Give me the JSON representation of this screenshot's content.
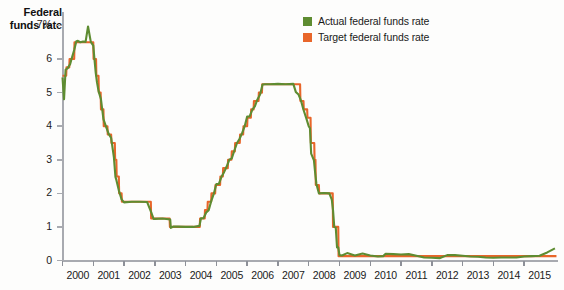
{
  "chart": {
    "title_line1": "Federal",
    "title_line2": "funds rate",
    "legend": [
      {
        "label": "Actual federal funds rate",
        "color": "#5e8c31",
        "icon": "square-swatch-icon"
      },
      {
        "label": "Target federal funds rate",
        "color": "#e8662a",
        "icon": "square-swatch-icon"
      }
    ]
  },
  "chart_data": {
    "type": "line",
    "title": "Federal funds rate",
    "xlabel": "",
    "ylabel": "Federal funds rate",
    "ylim": [
      0,
      7.4
    ],
    "xlim": [
      2000,
      2016.1
    ],
    "grid": false,
    "legend_position": "top-right",
    "ytick_labels": [
      "0",
      "1",
      "2",
      "3",
      "4",
      "5",
      "6",
      "7%"
    ],
    "ytick_values": [
      0,
      1,
      2,
      3,
      4,
      5,
      6,
      7
    ],
    "xtick_labels": [
      "2000",
      "2001",
      "2002",
      "2003",
      "2004",
      "2005",
      "2006",
      "2007",
      "2008",
      "2009",
      "2010",
      "2011",
      "2012",
      "2013",
      "2014",
      "2015"
    ],
    "xtick_values": [
      2000,
      2001,
      2002,
      2003,
      2004,
      2005,
      2006,
      2007,
      2008,
      2009,
      2010,
      2011,
      2012,
      2013,
      2014,
      2015
    ],
    "units": "percent",
    "series": [
      {
        "name": "Actual federal funds rate",
        "color": "#5e8c31",
        "x": [
          2000.0,
          2000.05,
          2000.1,
          2000.17,
          2000.25,
          2000.3,
          2000.38,
          2000.45,
          2000.5,
          2000.58,
          2000.67,
          2000.75,
          2000.83,
          2000.92,
          2001.0,
          2001.04,
          2001.08,
          2001.12,
          2001.17,
          2001.25,
          2001.33,
          2001.42,
          2001.5,
          2001.58,
          2001.67,
          2001.72,
          2001.75,
          2001.83,
          2001.92,
          2002.0,
          2002.25,
          2002.5,
          2002.75,
          2002.88,
          2002.96,
          2003.0,
          2003.25,
          2003.5,
          2003.52,
          2003.6,
          2003.75,
          2004.0,
          2004.25,
          2004.45,
          2004.5,
          2004.58,
          2004.67,
          2004.75,
          2004.83,
          2004.92,
          2005.0,
          2005.08,
          2005.17,
          2005.25,
          2005.33,
          2005.42,
          2005.5,
          2005.58,
          2005.67,
          2005.75,
          2005.83,
          2005.92,
          2006.0,
          2006.08,
          2006.17,
          2006.25,
          2006.33,
          2006.42,
          2006.5,
          2006.58,
          2006.75,
          2007.0,
          2007.25,
          2007.5,
          2007.58,
          2007.67,
          2007.75,
          2007.83,
          2007.92,
          2008.0,
          2008.04,
          2008.08,
          2008.17,
          2008.21,
          2008.25,
          2008.33,
          2008.5,
          2008.67,
          2008.75,
          2008.79,
          2008.83,
          2008.88,
          2008.92,
          2008.96,
          2009.0,
          2009.08,
          2009.25,
          2009.5,
          2009.75,
          2010.0,
          2010.25,
          2010.42,
          2010.5,
          2010.75,
          2011.0,
          2011.25,
          2011.5,
          2011.75,
          2012.0,
          2012.25,
          2012.5,
          2012.75,
          2013.0,
          2013.25,
          2013.5,
          2013.75,
          2014.0,
          2014.25,
          2014.5,
          2014.75,
          2015.0,
          2015.25,
          2015.5,
          2015.75,
          2016.0
        ],
        "y": [
          5.45,
          4.8,
          5.68,
          5.73,
          5.85,
          6.02,
          6.27,
          6.53,
          6.54,
          6.5,
          6.52,
          6.51,
          6.97,
          6.51,
          6.4,
          5.98,
          5.59,
          5.31,
          5.05,
          4.8,
          4.21,
          3.97,
          3.77,
          3.65,
          3.07,
          2.49,
          2.4,
          2.09,
          1.82,
          1.73,
          1.75,
          1.75,
          1.74,
          1.44,
          1.24,
          1.24,
          1.25,
          1.22,
          0.97,
          1.01,
          1.01,
          1.0,
          1.0,
          1.03,
          1.26,
          1.26,
          1.43,
          1.5,
          1.76,
          2.0,
          2.28,
          2.28,
          2.5,
          2.63,
          2.79,
          3.0,
          3.04,
          3.26,
          3.5,
          3.62,
          3.78,
          4.0,
          4.29,
          4.29,
          4.49,
          4.59,
          4.79,
          4.94,
          5.24,
          5.25,
          5.25,
          5.26,
          5.25,
          5.26,
          5.02,
          4.94,
          4.76,
          4.49,
          4.24,
          4.0,
          3.94,
          3.18,
          2.98,
          2.61,
          2.28,
          2.0,
          2.01,
          2.0,
          1.81,
          1.5,
          1.0,
          0.97,
          0.39,
          0.39,
          0.16,
          0.15,
          0.22,
          0.15,
          0.21,
          0.15,
          0.12,
          0.13,
          0.2,
          0.19,
          0.18,
          0.19,
          0.14,
          0.09,
          0.08,
          0.07,
          0.16,
          0.16,
          0.14,
          0.12,
          0.11,
          0.09,
          0.08,
          0.09,
          0.09,
          0.09,
          0.12,
          0.13,
          0.14,
          0.24,
          0.36
        ]
      },
      {
        "name": "Target federal funds rate",
        "color": "#e8662a",
        "x": [
          2000.0,
          2000.12,
          2000.13,
          2000.22,
          2000.23,
          2000.3,
          2000.31,
          2000.38,
          2000.39,
          2000.48,
          2000.49,
          2001.0,
          2001.01,
          2001.09,
          2001.1,
          2001.17,
          2001.18,
          2001.24,
          2001.25,
          2001.33,
          2001.34,
          2001.46,
          2001.47,
          2001.58,
          2001.59,
          2001.7,
          2001.71,
          2001.75,
          2001.76,
          2001.83,
          2001.84,
          2001.92,
          2001.93,
          2002.87,
          2002.88,
          2003.48,
          2003.49,
          2004.46,
          2004.47,
          2004.62,
          2004.63,
          2004.71,
          2004.72,
          2004.83,
          2004.84,
          2004.96,
          2004.97,
          2005.12,
          2005.13,
          2005.21,
          2005.22,
          2005.37,
          2005.38,
          2005.49,
          2005.5,
          2005.6,
          2005.61,
          2005.76,
          2005.77,
          2005.87,
          2005.88,
          2006.0,
          2006.01,
          2006.12,
          2006.13,
          2006.21,
          2006.22,
          2006.37,
          2006.38,
          2006.48,
          2006.49,
          2007.72,
          2007.73,
          2007.83,
          2007.84,
          2007.95,
          2007.96,
          2008.06,
          2008.07,
          2008.18,
          2008.19,
          2008.22,
          2008.23,
          2008.33,
          2008.34,
          2008.78,
          2008.79,
          2008.96,
          2008.97,
          2016.05
        ],
        "y": [
          5.5,
          5.5,
          5.75,
          5.75,
          6.0,
          6.0,
          6.0,
          6.0,
          6.5,
          6.5,
          6.5,
          6.5,
          6.0,
          6.0,
          5.5,
          5.5,
          5.0,
          5.0,
          4.5,
          4.5,
          4.0,
          4.0,
          3.75,
          3.75,
          3.5,
          3.5,
          3.0,
          3.0,
          2.5,
          2.5,
          2.0,
          2.0,
          1.75,
          1.75,
          1.25,
          1.25,
          1.0,
          1.0,
          1.25,
          1.25,
          1.5,
          1.5,
          1.75,
          1.75,
          2.0,
          2.0,
          2.25,
          2.25,
          2.5,
          2.5,
          2.75,
          2.75,
          3.0,
          3.0,
          3.25,
          3.25,
          3.5,
          3.5,
          3.75,
          3.75,
          4.0,
          4.0,
          4.25,
          4.25,
          4.5,
          4.5,
          4.75,
          4.75,
          5.0,
          5.0,
          5.25,
          5.25,
          4.75,
          4.75,
          4.5,
          4.5,
          4.25,
          4.25,
          3.5,
          3.5,
          3.0,
          3.0,
          2.25,
          2.25,
          2.0,
          2.0,
          1.0,
          1.0,
          0.13,
          0.13
        ]
      }
    ]
  }
}
